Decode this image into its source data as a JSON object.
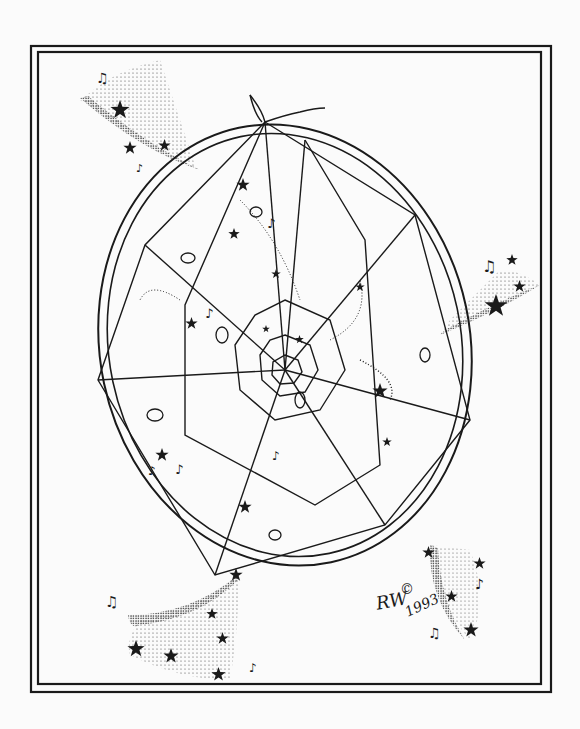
{
  "artwork": {
    "subject": "Dreamcatcher with stars and music notes",
    "signature": {
      "copyright_symbol": "©",
      "year": "1993",
      "initials": "RW"
    },
    "colors": {
      "ink": "#1a1a1a",
      "paper": "#fbfbfb"
    },
    "frame": {
      "outer": {
        "x": 31,
        "y": 46,
        "w": 520,
        "h": 646
      },
      "inner": {
        "x": 38,
        "y": 52,
        "w": 503,
        "h": 632
      }
    },
    "stars_count": 30,
    "music_notes": [
      "♫",
      "♪",
      "♬",
      "♪",
      "♫",
      "♪",
      "♫",
      "♪",
      "♫",
      "♪"
    ]
  }
}
